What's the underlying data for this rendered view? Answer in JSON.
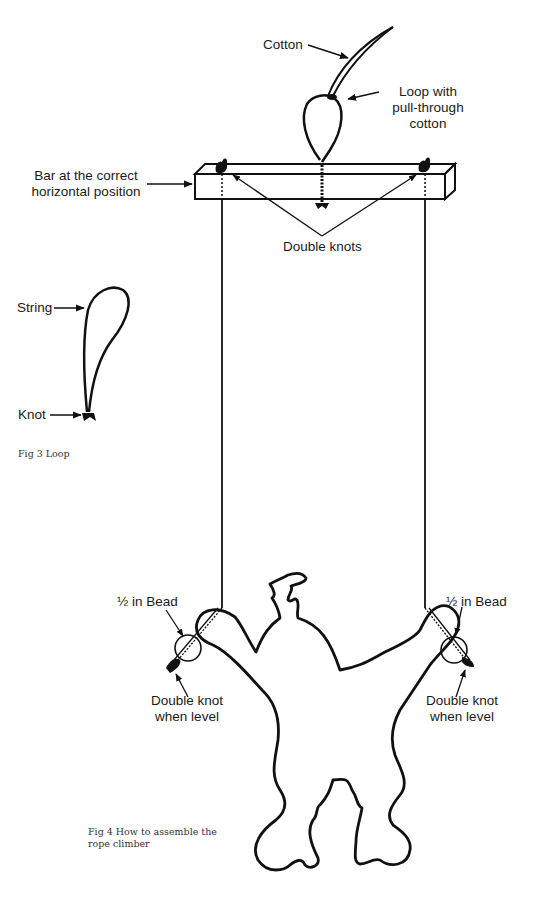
{
  "figure4": {
    "labels": {
      "cotton": "Cotton",
      "loop_line1": "Loop with",
      "loop_line2": "pull-through",
      "loop_line3": "cotton",
      "bar_line1": "Bar at the correct",
      "bar_line2": "horizontal position",
      "double_knots": "Double knots",
      "bead_left": "½ in Bead",
      "bead_right": "½ in Bead",
      "knot_left_line1": "Double knot",
      "knot_left_line2": "when level",
      "knot_right_line1": "Double knot",
      "knot_right_line2": "when level"
    },
    "caption_line1": "Fig 4 How to assemble the",
    "caption_line2": "rope climber"
  },
  "figure3": {
    "labels": {
      "string": "String",
      "knot": "Knot"
    },
    "caption": "Fig 3 Loop"
  },
  "colors": {
    "ink": "#111111",
    "background": "#ffffff"
  }
}
